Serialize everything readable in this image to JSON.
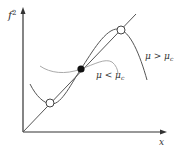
{
  "figure": {
    "y_axis_label": "f",
    "y_axis_superscript": "2",
    "x_axis_label": "x",
    "curves": [
      {
        "name": "mu-greater-than-mu-c",
        "label": "μ > μ",
        "subscript": "c",
        "color": "#555555"
      },
      {
        "name": "mu-less-than-mu-c",
        "label": "μ < μ",
        "subscript": "c",
        "color": "#aaaaaa"
      }
    ],
    "line": {
      "name": "diagonal-line",
      "color": "#555555"
    },
    "points": [
      {
        "name": "upper-open-circle",
        "type": "open"
      },
      {
        "name": "center-filled-dot",
        "type": "filled"
      },
      {
        "name": "lower-open-circle",
        "type": "open"
      }
    ]
  }
}
